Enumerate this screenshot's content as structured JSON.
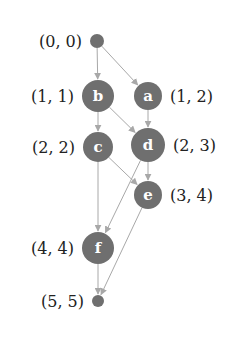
{
  "diagram": {
    "type": "directed-acyclic-graph",
    "colors": {
      "node": "#6f6f6f",
      "edge": "#a8a8a8",
      "node_text": "#ffffff",
      "label_text": "#222222"
    },
    "nodes": [
      {
        "id": "src",
        "letter": "",
        "coord": "(0, 0)",
        "cx": 97,
        "cy": 41,
        "r": 7,
        "label_side": "left"
      },
      {
        "id": "b",
        "letter": "b",
        "coord": "(1, 1)",
        "cx": 98,
        "cy": 96,
        "r": 16,
        "label_side": "left"
      },
      {
        "id": "a",
        "letter": "a",
        "coord": "(1, 2)",
        "cx": 148,
        "cy": 96,
        "r": 14,
        "label_side": "right"
      },
      {
        "id": "c",
        "letter": "c",
        "coord": "(2, 2)",
        "cx": 98,
        "cy": 147,
        "r": 15,
        "label_side": "left"
      },
      {
        "id": "d",
        "letter": "d",
        "coord": "(2, 3)",
        "cx": 148,
        "cy": 145,
        "r": 17,
        "label_side": "right"
      },
      {
        "id": "e",
        "letter": "e",
        "coord": "(3, 4)",
        "cx": 148,
        "cy": 195,
        "r": 14,
        "label_side": "right"
      },
      {
        "id": "f",
        "letter": "f",
        "coord": "(4, 4)",
        "cx": 98,
        "cy": 248,
        "r": 16,
        "label_side": "left"
      },
      {
        "id": "sink",
        "letter": "",
        "coord": "(5, 5)",
        "cx": 98,
        "cy": 301,
        "r": 6,
        "label_side": "left"
      }
    ],
    "edges": [
      {
        "from": "src",
        "to": "b"
      },
      {
        "from": "src",
        "to": "a"
      },
      {
        "from": "b",
        "to": "c"
      },
      {
        "from": "b",
        "to": "d"
      },
      {
        "from": "a",
        "to": "d"
      },
      {
        "from": "c",
        "to": "e"
      },
      {
        "from": "c",
        "to": "f"
      },
      {
        "from": "d",
        "to": "e"
      },
      {
        "from": "d",
        "to": "f"
      },
      {
        "from": "e",
        "to": "sink"
      },
      {
        "from": "f",
        "to": "sink"
      }
    ]
  }
}
